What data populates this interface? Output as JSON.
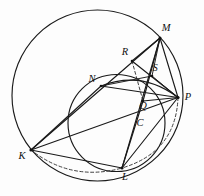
{
  "figure": {
    "background_color": "#fdfdfd",
    "stroke_color": "#1a1a1a",
    "dash_color": "#2b2b2b"
  },
  "circles": [
    {
      "name": "outer-circle",
      "cx": 97.5,
      "cy": 95.5,
      "r": 85.5,
      "style": "solid"
    },
    {
      "name": "inner-circle",
      "cx": 116.5,
      "cy": 123.0,
      "r": 48.5,
      "style": "solid"
    }
  ],
  "points": [
    {
      "id": "M",
      "label": "M",
      "x": 160.0,
      "y": 38.0,
      "lx": 166.0,
      "ly": 29.0
    },
    {
      "id": "R",
      "label": "R",
      "x": 132.0,
      "y": 61.0,
      "lx": 125.0,
      "ly": 53.0
    },
    {
      "id": "S",
      "label": "S",
      "x": 152.0,
      "y": 76.0,
      "lx": 155.0,
      "ly": 69.0
    },
    {
      "id": "N",
      "label": "N",
      "x": 101.0,
      "y": 86.0,
      "lx": 92.0,
      "ly": 80.0
    },
    {
      "id": "P",
      "label": "P",
      "x": 178.0,
      "y": 97.5,
      "lx": 187.0,
      "ly": 97.5
    },
    {
      "id": "Q",
      "label": "Q",
      "x": 143.0,
      "y": 101.0,
      "lx": 143.0,
      "ly": 106.5
    },
    {
      "id": "C",
      "label": "C",
      "x": 138.0,
      "y": 120.0,
      "lx": 140.0,
      "ly": 124.0
    },
    {
      "id": "K",
      "label": "K",
      "x": 31.0,
      "y": 150.0,
      "lx": 23.0,
      "ly": 156.0
    },
    {
      "id": "L",
      "label": "L",
      "x": 122.0,
      "y": 168.0,
      "lx": 124.5,
      "ly": 177.0
    }
  ],
  "segments": [
    {
      "name": "segment-K-M",
      "from": "K",
      "to": "M",
      "style": "solid",
      "weight": "normal"
    },
    {
      "name": "segment-K-N",
      "from": "K",
      "to": "N",
      "style": "solid",
      "weight": "normal"
    },
    {
      "name": "segment-K-P",
      "from": "K",
      "to": "P",
      "style": "solid",
      "weight": "normal"
    },
    {
      "name": "segment-K-L",
      "from": "K",
      "to": "L",
      "style": "solid",
      "weight": "normal"
    },
    {
      "name": "segment-N-P",
      "from": "N",
      "to": "P",
      "style": "solid",
      "weight": "normal"
    },
    {
      "name": "segment-N-S",
      "from": "N",
      "to": "S",
      "style": "solid",
      "weight": "thin"
    },
    {
      "name": "segment-M-P",
      "from": "M",
      "to": "P",
      "style": "solid",
      "weight": "normal"
    },
    {
      "name": "segment-M-Q",
      "from": "M",
      "to": "Q",
      "style": "solid",
      "weight": "normal"
    },
    {
      "name": "segment-M-S",
      "from": "M",
      "to": "S",
      "style": "solid",
      "weight": "thin"
    },
    {
      "name": "segment-M-R",
      "from": "M",
      "to": "R",
      "style": "solid",
      "weight": "normal"
    },
    {
      "name": "segment-R-P",
      "from": "R",
      "to": "P",
      "style": "solid",
      "weight": "normal"
    },
    {
      "name": "segment-S-P",
      "from": "S",
      "to": "P",
      "style": "solid",
      "weight": "thin"
    },
    {
      "name": "segment-Q-P",
      "from": "Q",
      "to": "P",
      "style": "solid",
      "weight": "normal"
    },
    {
      "name": "segment-L-P",
      "from": "L",
      "to": "P",
      "style": "solid",
      "weight": "normal"
    },
    {
      "name": "segment-L-M",
      "from": "L",
      "to": "M",
      "style": "solid",
      "weight": "normal"
    },
    {
      "name": "segment-L-Q",
      "from": "L",
      "to": "Q",
      "style": "solid",
      "weight": "normal"
    },
    {
      "name": "segment-R-Q-dashed",
      "from": "R",
      "to": "Q",
      "style": "dashed",
      "weight": "normal"
    }
  ],
  "arcs": [
    {
      "name": "arc-K-L-dashed",
      "from": "K",
      "to": "L",
      "style": "dashed",
      "path": "M 31 150 Q 72 182 122 168"
    },
    {
      "name": "arc-P-L-dashed",
      "from": "P",
      "to": "L",
      "style": "dashed",
      "path": "M 178 97.5 Q 176 152 122 168"
    },
    {
      "name": "arc-N-S-P-curve",
      "from": "N",
      "to": "P",
      "style": "solid",
      "path": "M 101 86 Q 142 70 178 97.5"
    }
  ]
}
